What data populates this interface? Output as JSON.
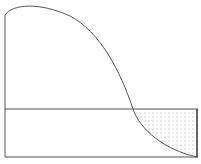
{
  "diagram": {
    "type": "curve-with-shaded-region",
    "colors": {
      "stroke": "#555555",
      "dots": "#888888",
      "background": "#ffffff"
    },
    "curve_points": "M5,15 C12,4 40,2 70,16 C100,32 120,70 133,109 C140,130 165,150 197,157",
    "shaded_region": "M133,109 L197,109 L197,157 C165,150 140,130 133,109 Z"
  }
}
